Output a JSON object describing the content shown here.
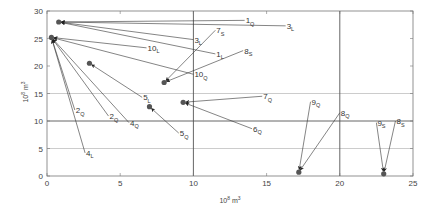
{
  "chart_data": {
    "type": "scatter",
    "title": "",
    "xlabel": "10^8 m^3",
    "ylabel": "10^8 m^3",
    "xlim": [
      0,
      25
    ],
    "ylim": [
      0,
      30
    ],
    "x_ticks": [
      0,
      5,
      10,
      15,
      20,
      25
    ],
    "y_ticks": [
      0,
      5,
      10,
      15,
      20,
      25,
      30
    ],
    "reference_lines": {
      "horizontal": [
        {
          "y": 10,
          "style": "dark"
        },
        {
          "y": 5,
          "style": "light"
        },
        {
          "y": 15,
          "style": "light"
        }
      ],
      "vertical": [
        {
          "x": 10,
          "style": "dark"
        },
        {
          "x": 20,
          "style": "dark"
        }
      ]
    },
    "points": [
      {
        "id": "A",
        "x": 0.8,
        "y": 28.0
      },
      {
        "id": "B",
        "x": 0.3,
        "y": 25.2
      },
      {
        "id": "C",
        "x": 2.9,
        "y": 20.5
      },
      {
        "id": "D",
        "x": 8.0,
        "y": 17.0
      },
      {
        "id": "E",
        "x": 9.3,
        "y": 13.4
      },
      {
        "id": "F",
        "x": 7.0,
        "y": 12.6
      },
      {
        "id": "G",
        "x": 17.2,
        "y": 0.7
      },
      {
        "id": "H",
        "x": 23.0,
        "y": 0.4
      }
    ],
    "annotations": [
      {
        "num": "1",
        "sub": "Q",
        "label_x": 13.5,
        "label_y": 28.3,
        "target": "A"
      },
      {
        "num": "3",
        "sub": "L",
        "label_x": 16.3,
        "label_y": 27.3,
        "target": "A"
      },
      {
        "num": "3",
        "sub": "L",
        "label_x": 10.0,
        "label_y": 24.8,
        "target": "A"
      },
      {
        "num": "1",
        "sub": "L",
        "label_x": 11.5,
        "label_y": 22.2,
        "target": "A"
      },
      {
        "num": "10",
        "sub": "L",
        "label_x": 6.8,
        "label_y": 23.3,
        "target": "B"
      },
      {
        "num": "10",
        "sub": "Q",
        "label_x": 10.0,
        "label_y": 18.5,
        "target": "B"
      },
      {
        "num": "5",
        "sub": "L",
        "label_x": 6.5,
        "label_y": 14.3,
        "target": "C"
      },
      {
        "num": "2",
        "sub": "Q",
        "label_x": 1.9,
        "label_y": 12.0,
        "target": "B"
      },
      {
        "num": "2",
        "sub": "Q",
        "label_x": 4.2,
        "label_y": 10.9,
        "target": "B"
      },
      {
        "num": "4",
        "sub": "Q",
        "label_x": 5.6,
        "label_y": 9.7,
        "target": "B"
      },
      {
        "num": "4",
        "sub": "L",
        "label_x": 2.6,
        "label_y": 4.2,
        "target": "B"
      },
      {
        "num": "7",
        "sub": "S",
        "label_x": 11.5,
        "label_y": 26.5,
        "target": "D"
      },
      {
        "num": "8",
        "sub": "S",
        "label_x": 13.4,
        "label_y": 22.8,
        "target": "D"
      },
      {
        "num": "7",
        "sub": "Q",
        "label_x": 14.7,
        "label_y": 14.5,
        "target": "E"
      },
      {
        "num": "6",
        "sub": "Q",
        "label_x": 14.0,
        "label_y": 8.6,
        "target": "E"
      },
      {
        "num": "5",
        "sub": "Q",
        "label_x": 9.0,
        "label_y": 7.8,
        "target": "F"
      },
      {
        "num": "9",
        "sub": "Q",
        "label_x": 18.0,
        "label_y": 13.5,
        "target": "G"
      },
      {
        "num": "8",
        "sub": "Q",
        "label_x": 20.0,
        "label_y": 11.5,
        "target": "G"
      },
      {
        "num": "9",
        "sub": "S",
        "label_x": 22.5,
        "label_y": 9.7,
        "target": "H"
      },
      {
        "num": "8",
        "sub": "S",
        "label_x": 23.8,
        "label_y": 10.0,
        "target": "H"
      }
    ],
    "colors": {
      "point": "#555555",
      "arrow": "#333333",
      "grid_dark": "#555555",
      "grid_light": "#aaaaaa",
      "axis": "#777777"
    },
    "grid": false,
    "legend": "none"
  }
}
